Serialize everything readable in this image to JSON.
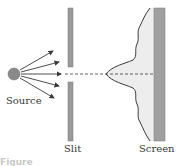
{
  "diagram": {
    "type": "single-slit diffraction",
    "labels": {
      "source": "Source",
      "slit": "Slit",
      "screen": "Screen"
    },
    "caption_partial": "Figure",
    "colors": {
      "source_fill": "#8a8a8a",
      "barrier_fill": "#9a9a9a",
      "screen_fill": "#a0a0a0",
      "pattern_fill": "#ededed",
      "line": "#3a3a3a"
    }
  }
}
